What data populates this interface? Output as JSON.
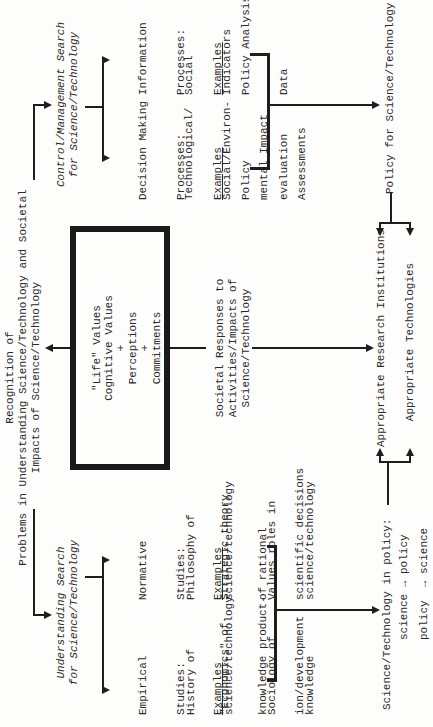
{
  "title": {
    "line1": "Recognition of",
    "line2": "Problems in Understanding Science/Technology and Societal",
    "line3": "Impacts of Science/Technology"
  },
  "center_box": {
    "line1": "\"Life\" Values",
    "line2": "Cognitive Values",
    "plus1": "+",
    "line3": "Perceptions",
    "plus2": "+",
    "line4": "Commitments"
  },
  "societal_responses": {
    "line1": "Societal Responses to",
    "line2": "Activities/Impacts of",
    "line3": "Science/Technology"
  },
  "understanding_search": {
    "line1": "Understanding Search",
    "line2": "for Science/Technology",
    "empirical": {
      "heading": [
        "Empirical",
        "Studies:",
        "Examples"
      ],
      "examples": [
        [
          "History of",
          "science/technology"
        ],
        [
          "\"Economics\" of",
          "knowledge product-",
          "ion/development"
        ],
        [
          "Sociology of",
          "knowledge"
        ]
      ]
    },
    "normative": {
      "heading": [
        "Normative",
        "Studies:",
        "Examples"
      ],
      "examples": [
        [
          "Philosophy of",
          "science/technology"
        ],
        [
          "Strategic theory",
          "of rational",
          "scientific decisions"
        ],
        [
          "Values roles in",
          "science/technology"
        ]
      ]
    }
  },
  "control_search": {
    "line1": "Control/Management Search",
    "line2": "for Science/Technology",
    "decision": {
      "heading": [
        "Decision Making",
        "Processes:",
        "Examples"
      ],
      "examples": [
        [
          "Technological/",
          "Social/Environ-",
          "mental Impact",
          "Assessments"
        ],
        [
          "Policy",
          "evaluation"
        ]
      ]
    },
    "information": {
      "heading": [
        "Information",
        "Processes:",
        "Examples"
      ],
      "examples": [
        [
          "Social",
          "Indicators"
        ],
        [
          "Policy Analysis",
          "Data"
        ]
      ]
    }
  },
  "bottom": {
    "science_in_policy": "Science/Technology in policy:",
    "science_to_policy": "science → policy",
    "policy_to_science": "policy  → science",
    "research_institutions": "Appropriate Research Institutions",
    "technologies": "Appropriate Technologies",
    "policy_for_science": "Policy for Science/Technology"
  },
  "colors": {
    "ink": "#1e1e1e",
    "paper": "#fdfdfb"
  }
}
